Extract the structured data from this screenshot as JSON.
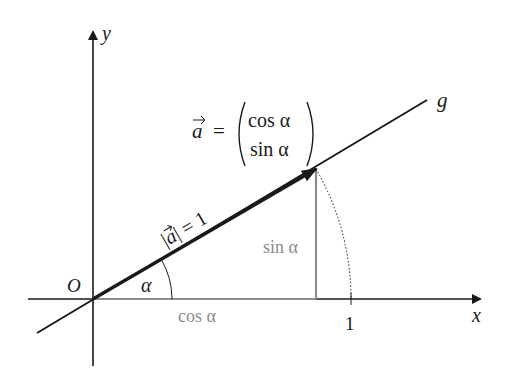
{
  "diagram": {
    "axes": {
      "x_label": "x",
      "y_label": "y",
      "origin_label": "O",
      "tick_label_x": "1"
    },
    "line_label": "g",
    "vector": {
      "lhs": "a",
      "equals": "=",
      "component_top": "cos α",
      "component_bottom": "sin α"
    },
    "magnitude_label": "|a| = 1",
    "angle_label": "α",
    "cos_label": "cos α",
    "sin_label": "sin α",
    "colors": {
      "main": "#1a1a1a",
      "gray": "#8c8c8c"
    }
  }
}
